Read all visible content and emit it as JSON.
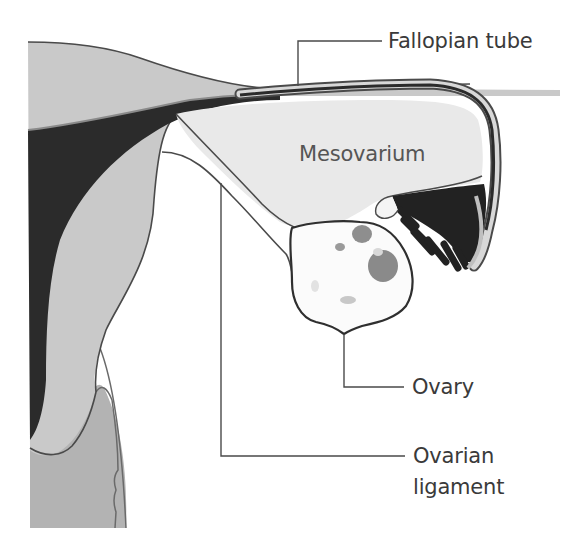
{
  "figure": {
    "labels": {
      "fallopian_tube": "Fallopian tube",
      "mesovarium": "Mesovarium",
      "ovary": "Ovary",
      "ovarian_ligament_line1": "Ovarian",
      "ovarian_ligament_line2": "ligament"
    },
    "colors": {
      "background": "#ffffff",
      "uterine_wall": "#c9c9c9",
      "uterine_cavity": "#2b2b2b",
      "mesovarium_fill": "#e9e9e9",
      "cervix_fill": "#b3b3b3",
      "outline": "#4a4a4a",
      "ovary_follicles": "#8e8e8e",
      "label_text": "#3a3a3a"
    }
  }
}
